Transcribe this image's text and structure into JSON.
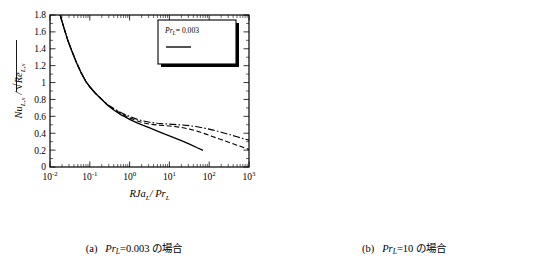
{
  "figure": {
    "panels": [
      {
        "id": "a",
        "caption_label": "(a)",
        "caption_math_var": "Pr",
        "caption_math_sub": "L",
        "caption_value": "=0.003",
        "caption_suffix": "の場合",
        "caption_full": "(a)  Pr_L =0.003 の場合",
        "ylabel": "Nu_{L,x} / sqrt(Re_{L,x})",
        "xlabel": "RJa_L / Pr_L",
        "legend_title": "Pr_L= 0.003",
        "legend_entries": [
          {
            "label": "R= 10",
            "style": "solid"
          },
          {
            "label": "R= 100",
            "style": "dashed"
          },
          {
            "label": "R= 500",
            "style": "dashdot"
          }
        ]
      },
      {
        "id": "b",
        "caption_label": "(b)",
        "caption_math_var": "Pr",
        "caption_math_sub": "L",
        "caption_value": "=10",
        "caption_suffix": "の場合",
        "caption_full": "(b)  Pr_L =10 の場合",
        "ylabel": "Nu_{L,x} / sqrt(Re_{L,x})",
        "xlabel": "RJa_L / Pr_L",
        "legend_title": "Pr_L= 10",
        "legend_entries": [
          {
            "label": "R= 10",
            "style": "solid"
          },
          {
            "label": "R= 100",
            "style": "dashed"
          },
          {
            "label": "R= 500",
            "style": "dashdot"
          }
        ]
      }
    ]
  },
  "chart_data": [
    {
      "id": "chart-a",
      "type": "line",
      "title": "",
      "xlabel": "RJa_L / Pr_L",
      "ylabel": "Nu_L,x / sqrt(Re_L,x)",
      "xscale": "log",
      "yscale": "linear",
      "xlim": [
        0.01,
        1000
      ],
      "ylim": [
        0,
        1.8
      ],
      "xticks": [
        0.01,
        0.1,
        1,
        10,
        100,
        1000
      ],
      "xticklabels": [
        "10-2",
        "10-1",
        "100",
        "101",
        "102",
        "103"
      ],
      "yticks": [
        0,
        0.2,
        0.4,
        0.6,
        0.8,
        1,
        1.2,
        1.4,
        1.6,
        1.8
      ],
      "yticklabels": [
        "0",
        "0.2",
        "0.4",
        "0.6",
        "0.8",
        "1",
        "1.2",
        "1.4",
        "1.6",
        "1.8"
      ],
      "grid": false,
      "legend_position": "upper-right",
      "legend_note": "Pr_L= 0.003",
      "series": [
        {
          "name": "R= 10",
          "style": "solid",
          "x": [
            0.018,
            0.022,
            0.028,
            0.035,
            0.045,
            0.06,
            0.08,
            0.1,
            0.14,
            0.2,
            0.28,
            0.4,
            0.6,
            0.8,
            1.0,
            1.5,
            2.2,
            3.2,
            5.0,
            8.0,
            12.0,
            20.0,
            32.0,
            50.0,
            70.0
          ],
          "y": [
            1.8,
            1.66,
            1.5,
            1.38,
            1.25,
            1.12,
            1.01,
            0.95,
            0.87,
            0.8,
            0.73,
            0.675,
            0.62,
            0.59,
            0.565,
            0.525,
            0.492,
            0.462,
            0.425,
            0.385,
            0.353,
            0.312,
            0.272,
            0.228,
            0.197
          ]
        },
        {
          "name": "R= 100",
          "style": "dashed",
          "x": [
            0.018,
            0.022,
            0.028,
            0.035,
            0.045,
            0.06,
            0.08,
            0.1,
            0.14,
            0.2,
            0.28,
            0.4,
            0.6,
            0.8,
            1.0,
            1.5,
            2.2,
            3.2,
            5.0,
            8.0,
            12.0,
            20.0,
            32.0,
            50.0,
            80.0,
            120.0,
            200.0,
            320.0,
            500.0,
            800.0,
            1000.0
          ],
          "y": [
            1.8,
            1.66,
            1.5,
            1.38,
            1.25,
            1.12,
            1.01,
            0.95,
            0.87,
            0.8,
            0.735,
            0.685,
            0.635,
            0.605,
            0.582,
            0.548,
            0.523,
            0.508,
            0.497,
            0.49,
            0.482,
            0.468,
            0.449,
            0.424,
            0.392,
            0.362,
            0.325,
            0.29,
            0.258,
            0.225,
            0.207
          ]
        },
        {
          "name": "R= 500",
          "style": "dashdot",
          "x": [
            0.018,
            0.022,
            0.028,
            0.035,
            0.045,
            0.06,
            0.08,
            0.1,
            0.14,
            0.2,
            0.28,
            0.4,
            0.6,
            0.8,
            1.0,
            1.5,
            2.2,
            3.2,
            5.0,
            8.0,
            12.0,
            20.0,
            32.0,
            50.0,
            80.0,
            120.0,
            200.0,
            320.0,
            500.0,
            800.0,
            1000.0
          ],
          "y": [
            1.8,
            1.66,
            1.5,
            1.38,
            1.25,
            1.12,
            1.01,
            0.95,
            0.87,
            0.8,
            0.74,
            0.692,
            0.645,
            0.618,
            0.598,
            0.567,
            0.545,
            0.53,
            0.518,
            0.51,
            0.505,
            0.498,
            0.489,
            0.476,
            0.458,
            0.44,
            0.412,
            0.385,
            0.358,
            0.33,
            0.318
          ]
        }
      ]
    },
    {
      "id": "chart-b",
      "type": "line",
      "title": "",
      "xlabel": "RJa_L / Pr_L",
      "ylabel": "Nu_L,x / sqrt(Re_L,x)",
      "xscale": "log",
      "yscale": "log",
      "xlim": [
        0.001,
        100
      ],
      "ylim": [
        0.5,
        4
      ],
      "xticks": [
        0.001,
        0.01,
        0.1,
        1,
        10,
        100
      ],
      "xticklabels": [
        "10-3",
        "10-2",
        "10-1",
        "100",
        "101",
        "102"
      ],
      "yticks": [
        0.5,
        0.6,
        0.7,
        0.8,
        0.9,
        1,
        2,
        3,
        4
      ],
      "yticklabels": [
        "0.5",
        "0.6",
        "0.7",
        "0.8",
        "0.9",
        "1",
        "2",
        "3",
        "4"
      ],
      "grid": false,
      "legend_position": "lower-left",
      "legend_note": "Pr_L= 10",
      "reference_line_y": 1,
      "series": [
        {
          "name": "R= 10",
          "style": "solid",
          "x": [
            0.001,
            0.0014,
            0.002,
            0.003,
            0.0045,
            0.007,
            0.01,
            0.015,
            0.022,
            0.033,
            0.05,
            0.075,
            0.1,
            0.14,
            0.2,
            0.3,
            0.45,
            0.7,
            1.0,
            1.5,
            2.2,
            3.2,
            5.0,
            8.0,
            12.0,
            20.0,
            32.0,
            50.0,
            80.0,
            100.0
          ],
          "y": [
            4.0,
            3.62,
            3.28,
            2.92,
            2.6,
            2.28,
            2.05,
            1.82,
            1.62,
            1.43,
            1.27,
            1.13,
            1.06,
            1.0,
            1.0,
            0.935,
            0.876,
            0.826,
            0.794,
            0.775,
            0.767,
            0.768,
            0.78,
            0.804,
            0.83,
            0.864,
            0.893,
            0.917,
            0.938,
            0.948
          ]
        },
        {
          "name": "R= 100",
          "style": "dashed",
          "x": [
            0.001,
            0.0014,
            0.002,
            0.003,
            0.0045,
            0.007,
            0.01,
            0.015,
            0.022,
            0.033,
            0.05,
            0.075,
            0.1,
            0.14,
            0.2,
            0.3,
            0.45,
            0.7,
            1.0,
            1.5,
            2.2,
            3.2,
            5.0,
            8.0,
            12.0,
            20.0,
            32.0,
            50.0,
            80.0,
            100.0
          ],
          "y": [
            4.0,
            3.62,
            3.28,
            2.92,
            2.6,
            2.28,
            2.05,
            1.82,
            1.62,
            1.43,
            1.27,
            1.13,
            1.06,
            1.0,
            0.94,
            0.845,
            0.762,
            0.697,
            0.662,
            0.637,
            0.624,
            0.62,
            0.624,
            0.637,
            0.653,
            0.678,
            0.703,
            0.728,
            0.757,
            0.772
          ]
        },
        {
          "name": "R= 500",
          "style": "dashdot",
          "x": [
            0.001,
            0.0014,
            0.002,
            0.003,
            0.0045,
            0.007,
            0.01,
            0.015,
            0.022,
            0.033,
            0.05,
            0.075,
            0.1,
            0.14,
            0.2,
            0.3,
            0.45,
            0.7,
            1.0,
            1.5,
            2.2,
            3.2,
            5.0,
            8.0,
            12.0,
            20.0,
            32.0,
            50.0,
            80.0,
            100.0
          ],
          "y": [
            4.0,
            3.62,
            3.28,
            2.92,
            2.6,
            2.28,
            2.05,
            1.82,
            1.62,
            1.43,
            1.27,
            1.13,
            1.06,
            1.0,
            0.935,
            0.838,
            0.752,
            0.686,
            0.648,
            0.622,
            0.61,
            0.607,
            0.61,
            0.617,
            0.625,
            0.637,
            0.648,
            0.659,
            0.67,
            0.676
          ]
        }
      ]
    }
  ]
}
